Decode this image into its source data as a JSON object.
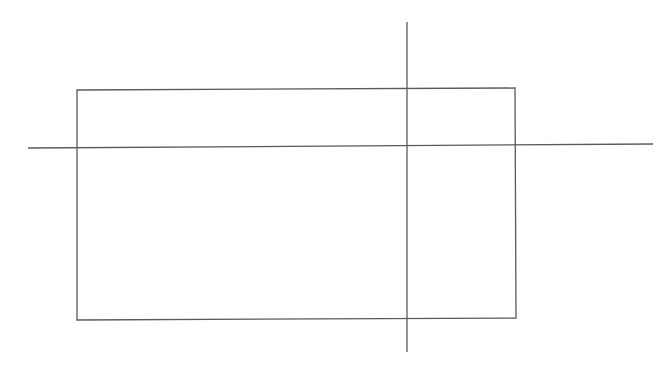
{
  "diagram": {
    "canvas": {
      "width": 670,
      "height": 368,
      "background": "#ffffff"
    },
    "stroke_color": "#5a5a5a",
    "stroke_width": 1.3,
    "rectangle": {
      "points": [
        [
          77,
          90
        ],
        [
          515,
          88
        ],
        [
          516,
          318
        ],
        [
          77,
          320
        ]
      ]
    },
    "horizontal_line": {
      "x1": 28,
      "y1": 148,
      "x2": 653,
      "y2": 144
    },
    "vertical_line": {
      "x1": 407,
      "y1": 22,
      "x2": 407,
      "y2": 352
    }
  }
}
